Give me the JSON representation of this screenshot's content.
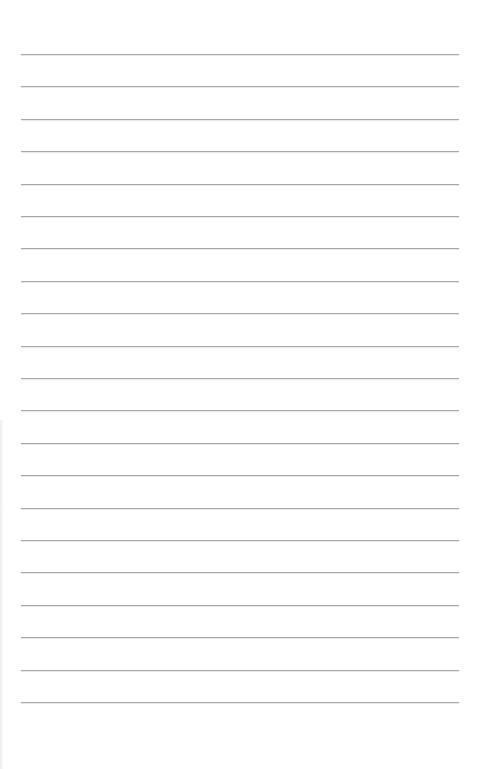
{
  "document": {
    "type": "lined-paper",
    "rule_count": 21,
    "rule_color": "#a9a9a9",
    "background_color": "#ffffff",
    "text_lines": [
      "",
      "",
      "",
      "",
      "",
      "",
      "",
      "",
      "",
      "",
      "",
      "",
      "",
      "",
      "",
      "",
      "",
      "",
      "",
      "",
      ""
    ]
  }
}
